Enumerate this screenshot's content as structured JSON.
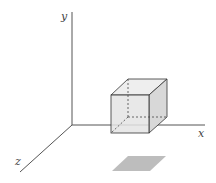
{
  "diagram": {
    "type": "3d-axes-with-cube",
    "axes": {
      "x_label": "x",
      "y_label": "y",
      "z_label": "z"
    },
    "colors": {
      "axis": "#555555",
      "cube_edge": "#333333",
      "cube_front": "#e6e6e6",
      "cube_top": "#eeeeee",
      "cube_side": "#d6d6d6",
      "shadow": "#bdbdbd"
    }
  }
}
